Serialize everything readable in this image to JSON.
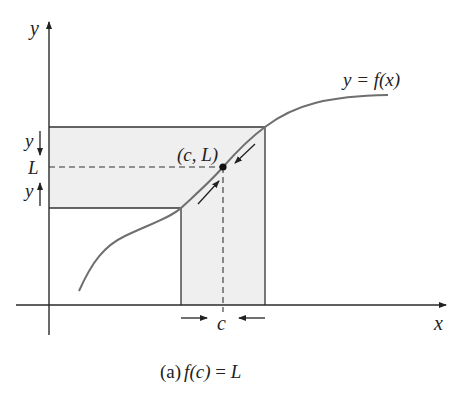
{
  "figure": {
    "caption": {
      "prefix": "(a)",
      "formula_f": "f",
      "formula_arg": "(c)",
      "formula_eq": " = ",
      "formula_L": "L"
    },
    "axes": {
      "x_label": "x",
      "y_label": "y"
    },
    "curve_label": "y = f(x)",
    "point_label": "(c, L)",
    "tick_labels": {
      "x_tick": "c",
      "y_tick": "L"
    },
    "band_labels": {
      "upper_arrow_label": "y",
      "lower_arrow_label": "y"
    },
    "colors": {
      "shading": "#efefef",
      "curve": "#6f6f6f",
      "axes": "#2a2a2a"
    }
  }
}
